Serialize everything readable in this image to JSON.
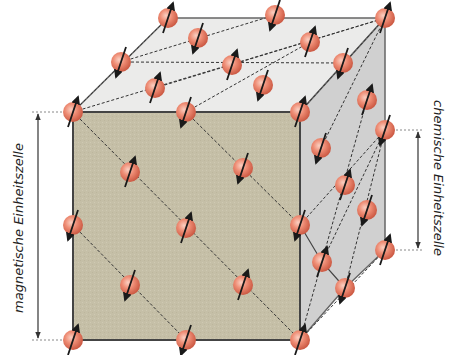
{
  "labels": {
    "magnetic_cell": {
      "word1": "magnetische",
      "word2": "Einheitszelle"
    },
    "chemical_cell": {
      "word1": "chemische",
      "word2": "Einheitszelle"
    }
  },
  "colors": {
    "front_face": "#c7c1a9",
    "top_face": "#ebebea",
    "right_face": "#cfcfcf",
    "edge": "#555555",
    "atom": "#e8826c",
    "atom_highlight": "#f7b8a6",
    "spin_arrow": "#1a1a1a",
    "dashed_line": "#333333"
  },
  "atoms": [
    {
      "x": 73,
      "y": 112,
      "spin": "up"
    },
    {
      "x": 186,
      "y": 112,
      "spin": "down"
    },
    {
      "x": 300,
      "y": 112,
      "spin": "up"
    },
    {
      "x": 130,
      "y": 172,
      "spin": "up"
    },
    {
      "x": 243,
      "y": 168,
      "spin": "down"
    },
    {
      "x": 73,
      "y": 225,
      "spin": "down"
    },
    {
      "x": 186,
      "y": 228,
      "spin": "up"
    },
    {
      "x": 300,
      "y": 225,
      "spin": "down"
    },
    {
      "x": 130,
      "y": 285,
      "spin": "down"
    },
    {
      "x": 243,
      "y": 285,
      "spin": "up"
    },
    {
      "x": 73,
      "y": 340,
      "spin": "up"
    },
    {
      "x": 186,
      "y": 340,
      "spin": "down"
    },
    {
      "x": 300,
      "y": 340,
      "spin": "up"
    },
    {
      "x": 168,
      "y": 18,
      "spin": "up"
    },
    {
      "x": 275,
      "y": 15,
      "spin": "down"
    },
    {
      "x": 385,
      "y": 18,
      "spin": "up"
    },
    {
      "x": 198,
      "y": 38,
      "spin": "down"
    },
    {
      "x": 310,
      "y": 42,
      "spin": "up"
    },
    {
      "x": 121,
      "y": 62,
      "spin": "down"
    },
    {
      "x": 232,
      "y": 65,
      "spin": "up"
    },
    {
      "x": 343,
      "y": 63,
      "spin": "down"
    },
    {
      "x": 155,
      "y": 88,
      "spin": "up"
    },
    {
      "x": 263,
      "y": 85,
      "spin": "down"
    },
    {
      "x": 367,
      "y": 100,
      "spin": "up"
    },
    {
      "x": 385,
      "y": 130,
      "spin": "down"
    },
    {
      "x": 321,
      "y": 148,
      "spin": "down"
    },
    {
      "x": 345,
      "y": 185,
      "spin": "up"
    },
    {
      "x": 367,
      "y": 210,
      "spin": "down"
    },
    {
      "x": 385,
      "y": 250,
      "spin": "up"
    },
    {
      "x": 322,
      "y": 262,
      "spin": "up"
    },
    {
      "x": 345,
      "y": 288,
      "spin": "down"
    }
  ],
  "dashed_lines": [
    [
      73,
      112,
      300,
      340
    ],
    [
      186,
      112,
      300,
      225
    ],
    [
      73,
      225,
      186,
      340
    ],
    [
      73,
      112,
      385,
      18
    ],
    [
      121,
      62,
      343,
      63
    ],
    [
      73,
      112,
      168,
      18
    ],
    [
      155,
      88,
      385,
      18
    ],
    [
      186,
      112,
      310,
      42
    ],
    [
      121,
      62,
      275,
      15
    ],
    [
      300,
      112,
      385,
      18
    ],
    [
      300,
      225,
      385,
      130
    ],
    [
      300,
      340,
      385,
      250
    ],
    [
      321,
      148,
      385,
      18
    ],
    [
      322,
      262,
      385,
      130
    ],
    [
      300,
      340,
      367,
      100
    ],
    [
      345,
      288,
      385,
      130
    ]
  ],
  "measure_magnetic": {
    "x": 38,
    "y1": 112,
    "y2": 340
  },
  "measure_chemical": {
    "x": 418,
    "y1": 130,
    "y2": 250
  }
}
